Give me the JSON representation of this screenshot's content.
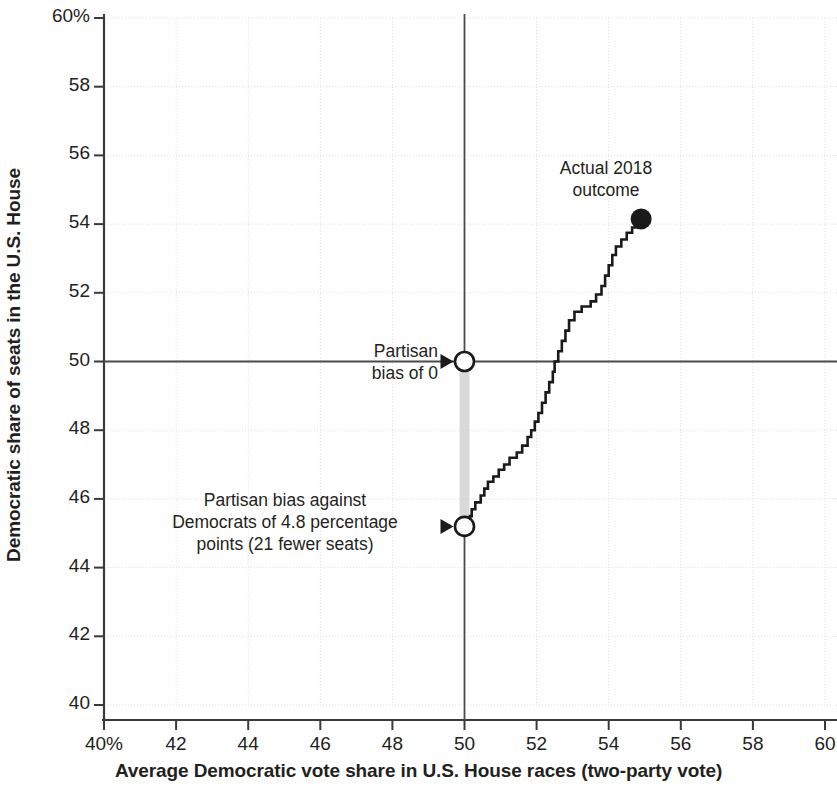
{
  "chart_data": {
    "type": "line",
    "title": "",
    "subtitle": "",
    "xlabel": "Average Democratic vote share in U.S. House races (two-party vote)",
    "ylabel": "Democratic share of seats in the U.S. House",
    "xlim": [
      40,
      60
    ],
    "ylim": [
      40,
      60
    ],
    "grid": true,
    "legend_position": "none",
    "x_tick_labels": [
      "40%",
      "42",
      "44",
      "46",
      "48",
      "50",
      "52",
      "54",
      "56",
      "58",
      "60"
    ],
    "x_ticks": [
      40,
      42,
      44,
      46,
      48,
      50,
      52,
      54,
      56,
      58,
      60
    ],
    "y_tick_labels": [
      "60%",
      "58",
      "56",
      "54",
      "52",
      "50",
      "48",
      "46",
      "44",
      "42",
      "40"
    ],
    "y_ticks": [
      60,
      58,
      56,
      54,
      52,
      50,
      48,
      46,
      44,
      42,
      40
    ],
    "series": [
      {
        "name": "Seats-votes curve (step)",
        "style": "step",
        "color": "#1a1a1a",
        "points": [
          [
            50.0,
            45.2
          ],
          [
            50.05,
            45.4
          ],
          [
            50.15,
            45.5
          ],
          [
            50.2,
            45.7
          ],
          [
            50.3,
            45.9
          ],
          [
            50.45,
            46.1
          ],
          [
            50.55,
            46.3
          ],
          [
            50.65,
            46.5
          ],
          [
            50.8,
            46.65
          ],
          [
            50.95,
            46.85
          ],
          [
            51.1,
            47.0
          ],
          [
            51.25,
            47.2
          ],
          [
            51.45,
            47.35
          ],
          [
            51.6,
            47.55
          ],
          [
            51.75,
            47.8
          ],
          [
            51.85,
            48.0
          ],
          [
            51.95,
            48.25
          ],
          [
            52.05,
            48.5
          ],
          [
            52.15,
            48.8
          ],
          [
            52.25,
            49.1
          ],
          [
            52.35,
            49.4
          ],
          [
            52.45,
            49.7
          ],
          [
            52.5,
            50.0
          ],
          [
            52.6,
            50.3
          ],
          [
            52.7,
            50.6
          ],
          [
            52.8,
            50.9
          ],
          [
            52.9,
            51.2
          ],
          [
            53.05,
            51.45
          ],
          [
            53.25,
            51.6
          ],
          [
            53.5,
            51.75
          ],
          [
            53.65,
            51.95
          ],
          [
            53.8,
            52.2
          ],
          [
            53.9,
            52.5
          ],
          [
            54.0,
            52.8
          ],
          [
            54.1,
            53.1
          ],
          [
            54.2,
            53.35
          ],
          [
            54.35,
            53.55
          ],
          [
            54.5,
            53.75
          ],
          [
            54.65,
            53.9
          ],
          [
            54.8,
            54.05
          ],
          [
            54.9,
            54.15
          ]
        ]
      }
    ],
    "markers": [
      {
        "name": "actual-2018-outcome",
        "style": "filled-circle",
        "x": 54.9,
        "y": 54.15,
        "color": "#1a1a1a",
        "label": "Actual 2018\noutcome"
      },
      {
        "name": "partisan-bias-zero",
        "style": "open-circle",
        "x": 50.0,
        "y": 50.0,
        "color": "#1a1a1a",
        "label": "Partisan\nbias of 0"
      },
      {
        "name": "partisan-bias-against-democrats",
        "style": "open-circle",
        "x": 50.0,
        "y": 45.2,
        "color": "#1a1a1a",
        "label": "Partisan bias against\nDemocrats of 4.8 percentage\npoints (21 fewer seats)"
      }
    ],
    "reference_lines": [
      {
        "name": "vertical-50-percent-vote",
        "orientation": "vertical",
        "value": 50
      },
      {
        "name": "horizontal-50-percent-seats",
        "orientation": "horizontal",
        "value": 50
      }
    ],
    "shaded_bands": [
      {
        "name": "partisan-bias-band",
        "x": 50.0,
        "y_from": 45.2,
        "y_to": 50.0,
        "color": "#d9d9d9"
      }
    ]
  },
  "axes": {
    "x_title": "Average Democratic vote share in U.S. House races (two-party vote)",
    "y_title": "Democratic share of seats in the U.S. House"
  },
  "x_ticks": [
    {
      "label": "40%",
      "value": 40
    },
    {
      "label": "42",
      "value": 42
    },
    {
      "label": "44",
      "value": 44
    },
    {
      "label": "46",
      "value": 46
    },
    {
      "label": "48",
      "value": 48
    },
    {
      "label": "50",
      "value": 50
    },
    {
      "label": "52",
      "value": 52
    },
    {
      "label": "54",
      "value": 54
    },
    {
      "label": "56",
      "value": 56
    },
    {
      "label": "58",
      "value": 58
    },
    {
      "label": "60",
      "value": 60
    }
  ],
  "y_ticks": [
    {
      "label": "60%",
      "value": 60
    },
    {
      "label": "58",
      "value": 58
    },
    {
      "label": "56",
      "value": 56
    },
    {
      "label": "54",
      "value": 54
    },
    {
      "label": "52",
      "value": 52
    },
    {
      "label": "50",
      "value": 50
    },
    {
      "label": "48",
      "value": 48
    },
    {
      "label": "46",
      "value": 46
    },
    {
      "label": "44",
      "value": 44
    },
    {
      "label": "42",
      "value": 42
    },
    {
      "label": "40",
      "value": 40
    }
  ],
  "annotations": {
    "actual_line1": "Actual 2018",
    "actual_line2": "outcome",
    "bias0_line1": "Partisan",
    "bias0_line2": "bias of 0",
    "bias48_line1": "Partisan bias against",
    "bias48_line2": "Democrats of 4.8 percentage",
    "bias48_line3": "points (21 fewer seats)"
  },
  "colors": {
    "curve": "#1a1a1a",
    "grid": "#dedede",
    "axis": "#4d4d4d",
    "band": "#d9d9d9",
    "text": "#231f20"
  }
}
